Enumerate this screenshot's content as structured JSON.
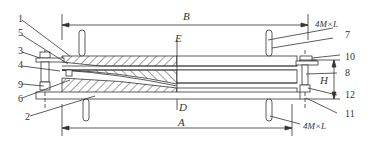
{
  "diagram": {
    "type": "mechanical-assembly-cross-section",
    "dimensions": {
      "top_span": "B",
      "bottom_span": "A",
      "height": "H",
      "section_top": "E",
      "section_bottom": "D",
      "bolt_top": "4M×L",
      "bolt_bottom": "4M×L"
    },
    "part_labels": {
      "p1": "1",
      "p2": "2",
      "p3": "3",
      "p4": "4",
      "p5": "5",
      "p6": "6",
      "p7": "7",
      "p8": "8",
      "p9": "9",
      "p10": "10",
      "p11": "11",
      "p12": "12"
    },
    "colors": {
      "line": "#333333",
      "background": "#ffffff"
    }
  }
}
